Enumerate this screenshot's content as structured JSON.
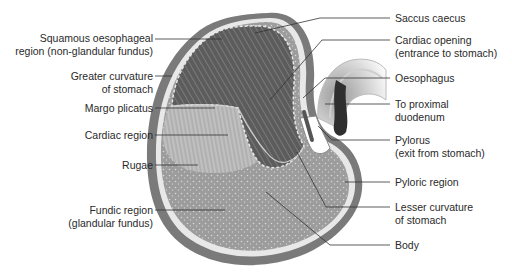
{
  "diagram": {
    "labels_left": [
      {
        "id": "squamous",
        "lines": [
          "Squamous oesophageal",
          "region (non-glandular fundus)"
        ]
      },
      {
        "id": "greater-curvature",
        "lines": [
          "Greater curvature",
          "of stomach"
        ]
      },
      {
        "id": "margo-plicatus",
        "lines": [
          "Margo plicatus"
        ]
      },
      {
        "id": "cardiac-region",
        "lines": [
          "Cardiac region"
        ]
      },
      {
        "id": "rugae",
        "lines": [
          "Rugae"
        ]
      },
      {
        "id": "fundic-region",
        "lines": [
          "Fundic region",
          "(glandular fundus)"
        ]
      }
    ],
    "labels_right": [
      {
        "id": "saccus-caecus",
        "lines": [
          "Saccus caecus"
        ]
      },
      {
        "id": "cardiac-opening",
        "lines": [
          "Cardiac opening",
          "(entrance to stomach)"
        ]
      },
      {
        "id": "oesophagus",
        "lines": [
          "Oesophagus"
        ]
      },
      {
        "id": "to-proximal-duodenum",
        "lines": [
          "To proximal",
          "duodenum"
        ]
      },
      {
        "id": "pylorus",
        "lines": [
          "Pylorus",
          "(exit from stomach)"
        ]
      },
      {
        "id": "pyloric-region",
        "lines": [
          "Pyloric region"
        ]
      },
      {
        "id": "lesser-curvature",
        "lines": [
          "Lesser curvature",
          "of stomach"
        ]
      },
      {
        "id": "body",
        "lines": [
          "Body"
        ]
      }
    ],
    "colors": {
      "outer_wall": "#7a7a7a",
      "inner_wall": "#e6e6e6",
      "squamous": "#5a5a5a",
      "glandular": "#9a9a9a",
      "cardiac": "#b8b8b8",
      "leader_line": "#333333",
      "text": "#2a2a2a"
    }
  }
}
